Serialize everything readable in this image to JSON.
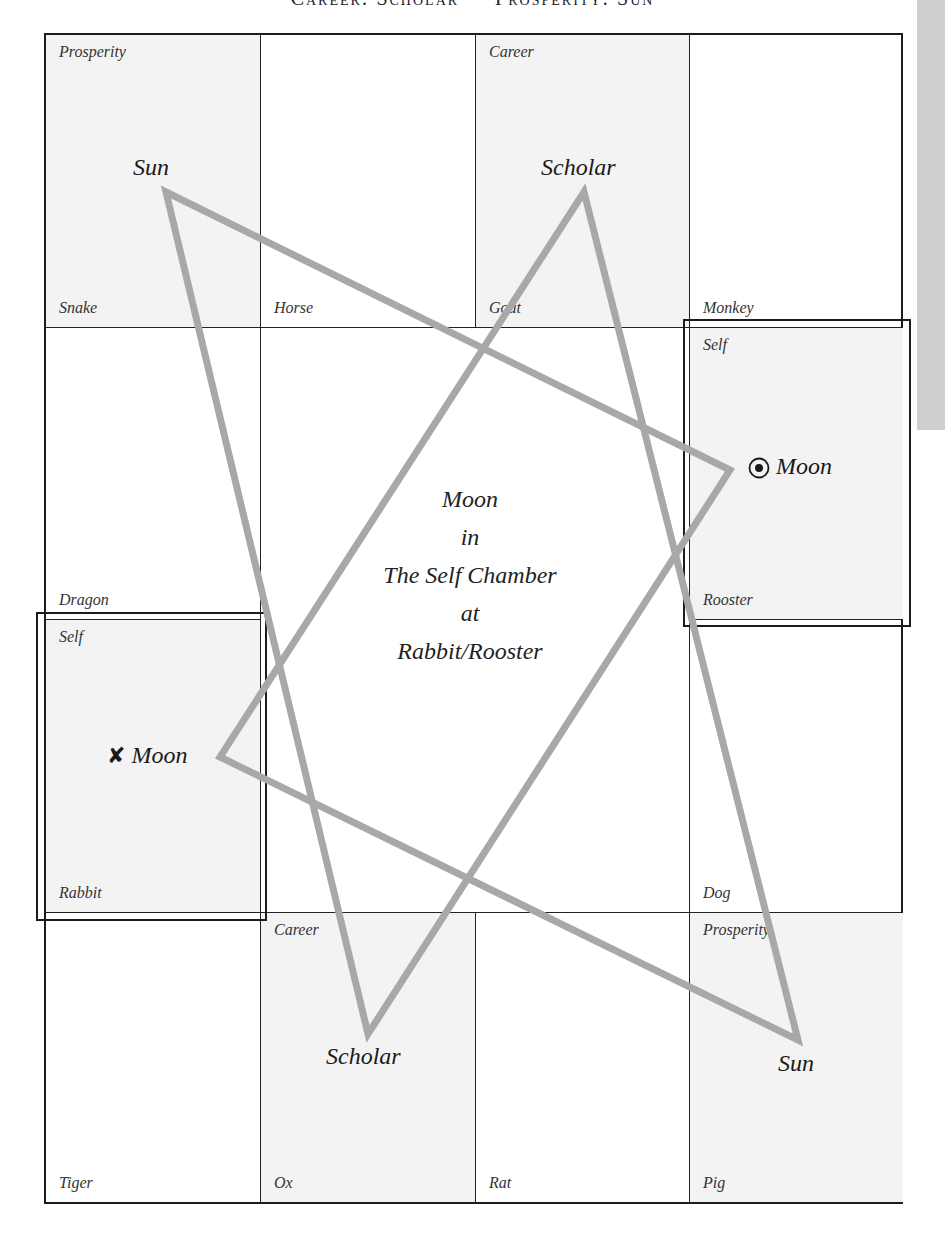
{
  "header": {
    "title": "Career: Scholar — Prosperity: Sun"
  },
  "colors": {
    "line": "#a8a8a8",
    "shade": "#f3f3f3",
    "border": "#1c1c1c",
    "side_tab": "#cfcfcf"
  },
  "grid": {
    "cells": [
      {
        "animal": "Snake",
        "chamber": "Prosperity",
        "shaded": true
      },
      {
        "animal": "Horse",
        "chamber": "",
        "shaded": false
      },
      {
        "animal": "Goat",
        "chamber": "Career",
        "shaded": true
      },
      {
        "animal": "Monkey",
        "chamber": "",
        "shaded": false
      },
      {
        "animal": "Dragon",
        "chamber": "",
        "shaded": false
      },
      {
        "animal": "Rooster",
        "chamber": "Self",
        "shaded": true
      },
      {
        "animal": "Rabbit",
        "chamber": "Self",
        "shaded": true
      },
      {
        "animal": "Dog",
        "chamber": "",
        "shaded": false
      },
      {
        "animal": "Tiger",
        "chamber": "",
        "shaded": false
      },
      {
        "animal": "Ox",
        "chamber": "Career",
        "shaded": true
      },
      {
        "animal": "Rat",
        "chamber": "",
        "shaded": false
      },
      {
        "animal": "Pig",
        "chamber": "Prosperity",
        "shaded": true
      }
    ]
  },
  "stars": {
    "sun_top": "Sun",
    "scholar_top": "Scholar",
    "moon_rooster": "Moon",
    "moon_rabbit": "Moon",
    "scholar_bottom": "Scholar",
    "sun_bottom": "Sun",
    "moon_rooster_symbol": "circled-dot",
    "moon_rabbit_symbol": "✘"
  },
  "center": {
    "lines": [
      "Moon",
      "in",
      "The Self Chamber",
      "at",
      "Rabbit/Rooster"
    ]
  }
}
